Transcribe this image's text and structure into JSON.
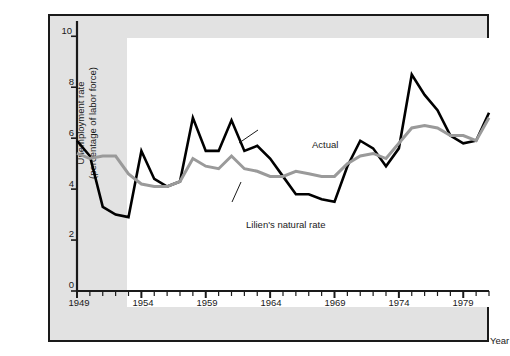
{
  "figure": {
    "background_color": "#ffffff",
    "matte_color": "#e2e2e2",
    "plot_background_color": "#ffffff",
    "frame_color": "#1a1a1a"
  },
  "chart_data": {
    "type": "line",
    "title": "",
    "subtitle": "",
    "xlabel": "Year",
    "ylabel": "Unemployment rate\n(percentage of labor force)",
    "ylabel_line1": "Unemployment rate",
    "ylabel_line2": "(percentage of labor force)",
    "xlim": [
      1949,
      1981
    ],
    "ylim": [
      0,
      10.6
    ],
    "yticks": [
      0,
      2,
      4,
      6,
      8,
      10
    ],
    "ytick_labels": [
      "0",
      "2",
      "4",
      "6",
      "8",
      "10"
    ],
    "xticks": [
      1949,
      1954,
      1959,
      1964,
      1969,
      1974,
      1979
    ],
    "xtick_labels": [
      "1949",
      "1954",
      "1959",
      "1964",
      "1969",
      "1974",
      "1979"
    ],
    "x_minor_tick_interval": 1,
    "grid": false,
    "legend_position": "inline-annotations",
    "x": [
      1949,
      1950,
      1951,
      1952,
      1953,
      1954,
      1955,
      1956,
      1957,
      1958,
      1959,
      1960,
      1961,
      1962,
      1963,
      1964,
      1965,
      1966,
      1967,
      1968,
      1969,
      1970,
      1971,
      1972,
      1973,
      1974,
      1975,
      1976,
      1977,
      1978,
      1979,
      1980,
      1981
    ],
    "series": [
      {
        "name": "Actual",
        "color": "#000000",
        "line_width": 2.6,
        "values": [
          5.9,
          5.3,
          3.3,
          3.0,
          2.9,
          5.5,
          4.4,
          4.1,
          4.3,
          6.8,
          5.5,
          5.5,
          6.7,
          5.5,
          5.7,
          5.2,
          4.5,
          3.8,
          3.8,
          3.6,
          3.5,
          4.9,
          5.9,
          5.6,
          4.9,
          5.6,
          8.5,
          7.7,
          7.1,
          6.1,
          5.8,
          5.9,
          7.0
        ]
      },
      {
        "name": "Lilien's natural rate",
        "color": "#9a9a9a",
        "line_width": 3.0,
        "values": [
          5.4,
          5.2,
          5.3,
          5.3,
          4.6,
          4.2,
          4.1,
          4.1,
          4.3,
          5.2,
          4.9,
          4.8,
          5.3,
          4.8,
          4.7,
          4.5,
          4.5,
          4.7,
          4.6,
          4.5,
          4.5,
          5.0,
          5.3,
          5.4,
          5.2,
          5.8,
          6.4,
          6.5,
          6.4,
          6.1,
          6.1,
          5.9,
          6.8
        ]
      }
    ],
    "annotations": [
      {
        "text": "Actual",
        "series": "Actual",
        "x": 262,
        "y": 123,
        "leader_from": [
          258,
          130
        ],
        "leader_to": [
          239,
          143
        ]
      },
      {
        "text": "Lilien's natural rate",
        "series": "Lilien's natural rate",
        "x": 196,
        "y": 203,
        "leader_from": [
          232,
          202
        ],
        "leader_to": [
          241,
          182
        ]
      }
    ]
  }
}
